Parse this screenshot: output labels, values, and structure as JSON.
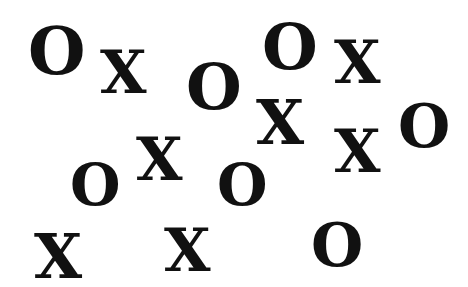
{
  "canvas": {
    "width": 468,
    "height": 287,
    "background": "#ffffff",
    "ink": "#111111"
  },
  "glyphs": [
    {
      "char": "O",
      "x": 28,
      "y": 18,
      "size": 66
    },
    {
      "char": "X",
      "x": 100,
      "y": 42,
      "size": 60
    },
    {
      "char": "O",
      "x": 186,
      "y": 55,
      "size": 64
    },
    {
      "char": "O",
      "x": 262,
      "y": 15,
      "size": 64
    },
    {
      "char": "X",
      "x": 334,
      "y": 32,
      "size": 60
    },
    {
      "char": "X",
      "x": 256,
      "y": 92,
      "size": 62
    },
    {
      "char": "O",
      "x": 398,
      "y": 96,
      "size": 60
    },
    {
      "char": "X",
      "x": 334,
      "y": 121,
      "size": 60
    },
    {
      "char": "X",
      "x": 136,
      "y": 129,
      "size": 60
    },
    {
      "char": "O",
      "x": 70,
      "y": 156,
      "size": 58
    },
    {
      "char": "O",
      "x": 217,
      "y": 156,
      "size": 58
    },
    {
      "char": "X",
      "x": 34,
      "y": 226,
      "size": 62
    },
    {
      "char": "X",
      "x": 164,
      "y": 220,
      "size": 60
    },
    {
      "char": "O",
      "x": 311,
      "y": 215,
      "size": 60
    }
  ]
}
